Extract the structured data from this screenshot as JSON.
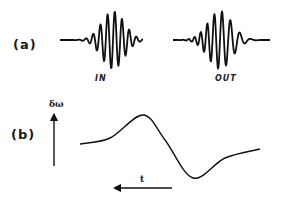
{
  "panel_a": {
    "label": "(a)",
    "in_wave": {
      "label": "IN",
      "x_start": 60,
      "x_end": 143,
      "center_y": 40,
      "envelope_center": 113,
      "envelope_width": 16,
      "amplitude": 29,
      "period": 7.2,
      "chirp": 0
    },
    "out_wave": {
      "label": "OUT",
      "x_start": 173,
      "x_end": 270,
      "center_y": 40,
      "envelope_center": 220,
      "envelope_width": 17,
      "amplitude": 29,
      "period": 7.8,
      "chirp": 0.045
    }
  },
  "panel_b": {
    "label": "(b)",
    "y_axis_label": "δω",
    "x_axis_label": "t",
    "curve_points": [
      [
        80,
        144
      ],
      [
        110,
        138
      ],
      [
        143,
        115
      ],
      [
        165,
        140
      ],
      [
        193,
        178
      ],
      [
        225,
        158
      ],
      [
        260,
        149
      ]
    ]
  },
  "colors": {
    "ink": "#111111",
    "background": "#ffffff"
  }
}
